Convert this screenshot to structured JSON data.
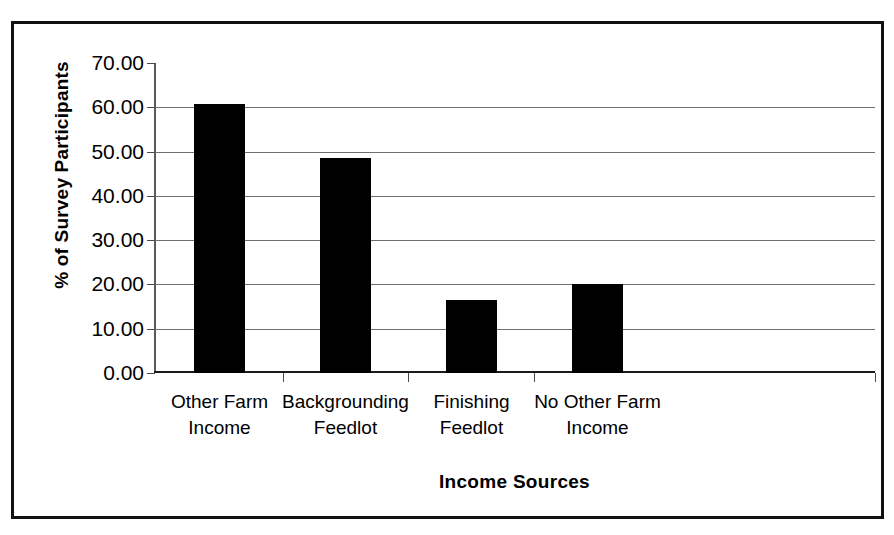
{
  "chart_data": {
    "type": "bar",
    "title": "",
    "xlabel": "Income Sources",
    "ylabel": "% of Survey Participants",
    "categories": [
      "Other Farm Income",
      "Backgrounding Feedlot",
      "Finishing Feedlot",
      "No Other Farm Income"
    ],
    "category_lines": [
      [
        "Other Farm",
        "Income"
      ],
      [
        "Backgrounding",
        "Feedlot"
      ],
      [
        "Finishing",
        "Feedlot"
      ],
      [
        "No Other Farm",
        "Income"
      ]
    ],
    "values": [
      60.7,
      48.5,
      16.5,
      20.0
    ],
    "ylim": [
      0,
      70
    ],
    "ytick_values": [
      70,
      60,
      50,
      40,
      30,
      20,
      10,
      0
    ],
    "ytick_labels": [
      "70.00",
      "60.00",
      "50.00",
      "40.00",
      "30.00",
      "20.00",
      "10.00",
      "0.00"
    ],
    "grid": true,
    "legend": "none",
    "bar_color": "#000000",
    "gridline_color": "#6f6f6f",
    "frame_color": "#111111"
  }
}
